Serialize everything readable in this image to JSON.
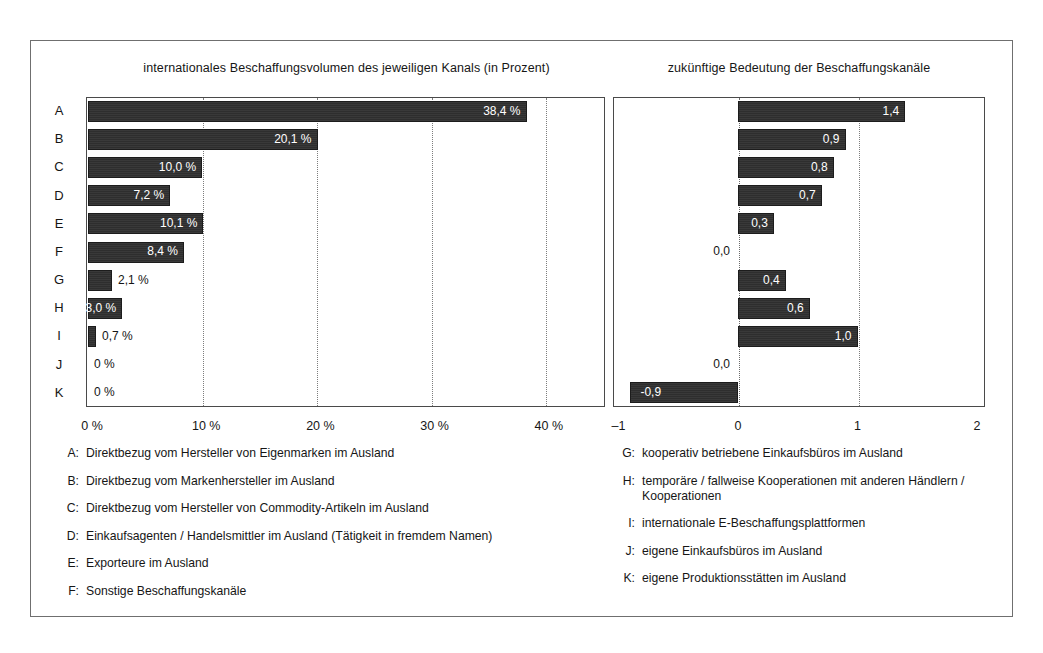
{
  "chart_data": [
    {
      "type": "bar",
      "orientation": "horizontal",
      "title": "internationales Beschaffungsvolumen des jeweiligen Kanals (in Prozent)",
      "xlabel": "",
      "ylabel": "",
      "categories": [
        "A",
        "B",
        "C",
        "D",
        "E",
        "F",
        "G",
        "H",
        "I",
        "J",
        "K"
      ],
      "values": [
        38.4,
        20.1,
        10.0,
        7.2,
        10.1,
        8.4,
        2.1,
        3.0,
        0.7,
        0,
        0
      ],
      "data_labels": [
        "38,4 %",
        "20,1 %",
        "10,0 %",
        "7,2 %",
        "10,1 %",
        "8,4 %",
        "2,1 %",
        "3,0 %",
        "0,7 %",
        "0 %",
        "0 %"
      ],
      "label_inside": [
        true,
        true,
        true,
        true,
        true,
        true,
        false,
        true,
        false,
        false,
        false
      ],
      "xlim": [
        0,
        45.5
      ],
      "xticks": [
        0,
        10,
        20,
        30,
        40
      ],
      "xtick_labels": [
        "0 %",
        "10 %",
        "20 %",
        "30 %",
        "40 %"
      ],
      "grid": "vertical-dotted"
    },
    {
      "type": "bar",
      "orientation": "horizontal",
      "title": "zukünftige Bedeutung der Beschaffungskanäle",
      "xlabel": "",
      "ylabel": "",
      "categories": [
        "A",
        "B",
        "C",
        "D",
        "E",
        "F",
        "G",
        "H",
        "I",
        "J",
        "K"
      ],
      "values": [
        1.4,
        0.9,
        0.8,
        0.7,
        0.3,
        0.0,
        0.4,
        0.6,
        1.0,
        0.0,
        -0.9
      ],
      "data_labels": [
        "1,4",
        "0,9",
        "0,8",
        "0,7",
        "0,3",
        "0,0",
        "0,4",
        "0,6",
        "1,0",
        "0,0",
        "-0,9"
      ],
      "label_inside": [
        true,
        true,
        true,
        true,
        true,
        false,
        true,
        true,
        true,
        false,
        true
      ],
      "xlim": [
        -1.05,
        2.07
      ],
      "xticks": [
        -1,
        0,
        1,
        2
      ],
      "xtick_labels": [
        "–1",
        "0",
        "1",
        "2"
      ],
      "grid": "vertical-dotted"
    }
  ],
  "legend_left": [
    {
      "key": "A:",
      "text": "Direktbezug vom Hersteller von Eigenmarken im Ausland"
    },
    {
      "key": "B:",
      "text": "Direktbezug vom Markenhersteller im Ausland"
    },
    {
      "key": "C:",
      "text": "Direktbezug vom Hersteller von Commodity-Artikeln im Ausland"
    },
    {
      "key": "D:",
      "text": "Einkaufsagenten / Handelsmittler im Ausland (Tätigkeit in fremdem Namen)"
    },
    {
      "key": "E:",
      "text": "Exporteure im Ausland"
    },
    {
      "key": "F:",
      "text": "Sonstige Beschaffungskanäle"
    }
  ],
  "legend_right": [
    {
      "key": "G:",
      "text": "kooperativ betriebene Einkaufsbüros im Ausland"
    },
    {
      "key": "H:",
      "text": "temporäre / fallweise Kooperationen mit anderen Händlern / Kooperationen"
    },
    {
      "key": "I:",
      "text": "internationale E-Beschaffungsplattformen"
    },
    {
      "key": "J:",
      "text": "eigene Einkaufsbüros im Ausland"
    },
    {
      "key": "K:",
      "text": "eigene Produktionsstätten im Ausland"
    }
  ],
  "colors": {
    "bar": "#2e2e2e",
    "frame": "#6f6f6f",
    "grid": "#7d7d7d",
    "text": "#161616",
    "bar_label": "#ffffff"
  }
}
